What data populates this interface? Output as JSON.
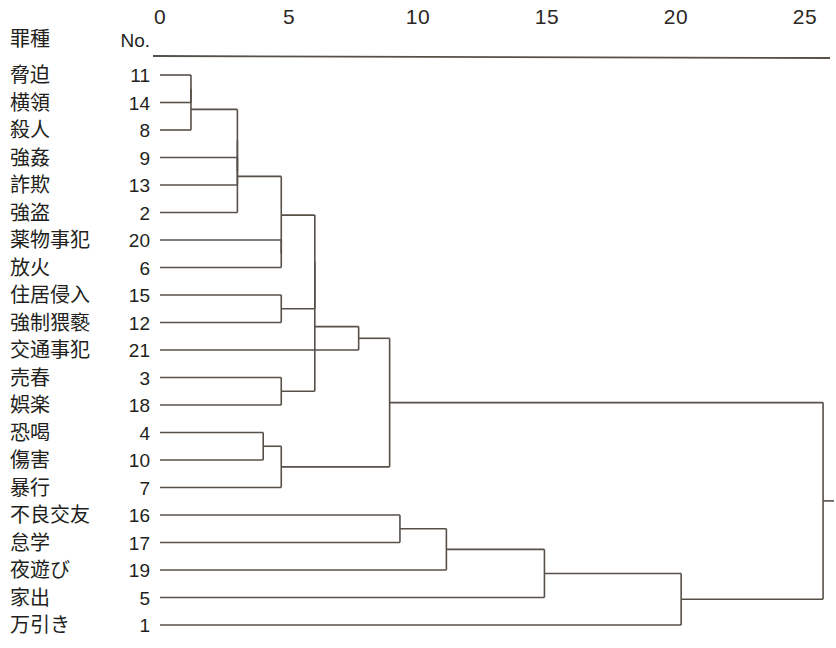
{
  "figure": {
    "title": "",
    "category_header": "罪種",
    "number_header": "No."
  },
  "axis": {
    "ticks": [
      {
        "label": "0",
        "value": 0
      },
      {
        "label": "5",
        "value": 5
      },
      {
        "label": "10",
        "value": 10
      },
      {
        "label": "15",
        "value": 15
      },
      {
        "label": "20",
        "value": 20
      },
      {
        "label": "25",
        "value": 25
      }
    ],
    "min": 0,
    "max": 25,
    "axis_color": "#575049"
  },
  "chart_data": {
    "type": "dendrogram",
    "title": "",
    "xlabel": "",
    "ylabel": "罪種",
    "xlim": [
      0,
      25
    ],
    "grid": false,
    "legend": "none",
    "orientation": "horizontal",
    "leaf_header_category": "罪種",
    "leaf_header_number": "No.",
    "leaves": [
      {
        "label": "脅迫",
        "no": "11"
      },
      {
        "label": "横領",
        "no": "14"
      },
      {
        "label": "殺人",
        "no": "8"
      },
      {
        "label": "強姦",
        "no": "9"
      },
      {
        "label": "詐欺",
        "no": "13"
      },
      {
        "label": "強盗",
        "no": "2"
      },
      {
        "label": "薬物事犯",
        "no": "20"
      },
      {
        "label": "放火",
        "no": "6"
      },
      {
        "label": "住居侵入",
        "no": "15"
      },
      {
        "label": "強制猥褻",
        "no": "12"
      },
      {
        "label": "交通事犯",
        "no": "21"
      },
      {
        "label": "売春",
        "no": "3"
      },
      {
        "label": "娯楽",
        "no": "18"
      },
      {
        "label": "恐喝",
        "no": "4"
      },
      {
        "label": "傷害",
        "no": "10"
      },
      {
        "label": "暴行",
        "no": "7"
      },
      {
        "label": "不良交友",
        "no": "16"
      },
      {
        "label": "怠学",
        "no": "17"
      },
      {
        "label": "夜遊び",
        "no": "19"
      },
      {
        "label": "家出",
        "no": "5"
      },
      {
        "label": "万引き",
        "no": "1"
      }
    ],
    "merges": [
      {
        "id": "m1",
        "children": [
          "脅迫",
          "横領"
        ],
        "distance": 1.2
      },
      {
        "id": "m2",
        "children": [
          "m1",
          "殺人"
        ],
        "distance": 1.2
      },
      {
        "id": "m3",
        "children": [
          "強姦",
          "詐欺"
        ],
        "distance": 3.0
      },
      {
        "id": "m4",
        "children": [
          "m2",
          "m3"
        ],
        "distance": 3.0
      },
      {
        "id": "m5",
        "children": [
          "m4",
          "強盗"
        ],
        "distance": 3.0
      },
      {
        "id": "m6",
        "children": [
          "薬物事犯",
          "放火"
        ],
        "distance": 4.7
      },
      {
        "id": "m7",
        "children": [
          "m5",
          "m6"
        ],
        "distance": 4.7
      },
      {
        "id": "m8",
        "children": [
          "住居侵入",
          "強制猥褻"
        ],
        "distance": 4.7
      },
      {
        "id": "m9",
        "children": [
          "m7",
          "m8"
        ],
        "distance": 6.0
      },
      {
        "id": "m10",
        "children": [
          "売春",
          "娯楽"
        ],
        "distance": 4.7
      },
      {
        "id": "m11",
        "children": [
          "m9",
          "m10"
        ],
        "distance": 6.0
      },
      {
        "id": "m12",
        "children": [
          "交通事犯",
          "m11"
        ],
        "distance": 7.7
      },
      {
        "id": "m13",
        "children": [
          "恐喝",
          "傷害"
        ],
        "distance": 4.0
      },
      {
        "id": "m14",
        "children": [
          "m13",
          "暴行"
        ],
        "distance": 4.7
      },
      {
        "id": "m15",
        "children": [
          "m12",
          "m14"
        ],
        "distance": 8.9
      },
      {
        "id": "m16",
        "children": [
          "不良交友",
          "怠学"
        ],
        "distance": 9.3
      },
      {
        "id": "m17",
        "children": [
          "m16",
          "夜遊び"
        ],
        "distance": 11.1
      },
      {
        "id": "m18",
        "children": [
          "m17",
          "家出"
        ],
        "distance": 14.9
      },
      {
        "id": "m19",
        "children": [
          "m18",
          "万引き"
        ],
        "distance": 20.2
      },
      {
        "id": "m20",
        "children": [
          "m15",
          "m19"
        ],
        "distance": 25.7
      }
    ]
  },
  "layout": {
    "x0_px": 160,
    "px_per_unit": 25.8,
    "first_row_y": 75,
    "row_step": 27.5,
    "label_x": 10,
    "number_right_x": 150
  }
}
